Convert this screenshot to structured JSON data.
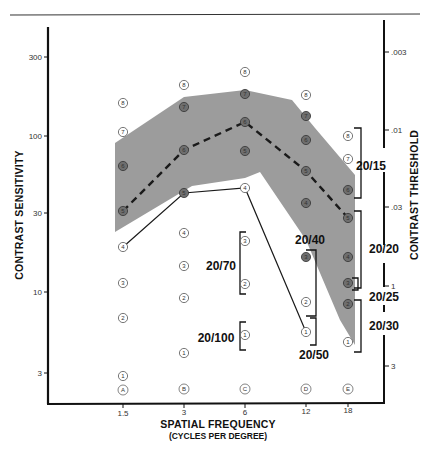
{
  "chart_data": {
    "type": "line",
    "title": "",
    "xlabel": "SPATIAL FREQUENCY",
    "xlabel_sub": "(CYCLES PER DEGREE)",
    "ylabel_left": "CONTRAST SENSITIVITY",
    "ylabel_right": "CONTRAST THRESHOLD",
    "x_ticks": [
      "1.5",
      "3",
      "6",
      "12",
      "18"
    ],
    "x_columns": [
      "A",
      "B",
      "C",
      "D",
      "E"
    ],
    "y_left_ticks": [
      "300",
      "100",
      "30",
      "10",
      "3"
    ],
    "y_right_ticks": [
      ".003",
      ".01",
      ".03",
      ".1",
      ".3"
    ],
    "y_scale": "log",
    "grid": false,
    "series": [
      {
        "name": "Normal population mean (dashed)",
        "style": "dashed",
        "x": [
          1.5,
          3,
          6,
          12,
          18
        ],
        "values": [
          31,
          70,
          120,
          55,
          28
        ],
        "row_labels": [
          5,
          6,
          6,
          5,
          5
        ]
      },
      {
        "name": "Patient curve (solid)",
        "style": "solid",
        "x": [
          1.5,
          3,
          6,
          12,
          18
        ],
        "values": [
          20,
          38,
          40,
          5.5,
          null
        ],
        "row_labels": [
          4,
          5,
          4,
          1,
          null
        ]
      },
      {
        "name": "Normal range upper bound (shaded)",
        "style": "band-upper",
        "x": [
          1.5,
          3,
          6,
          12,
          18
        ],
        "values": [
          85,
          160,
          180,
          110,
          40
        ]
      },
      {
        "name": "Normal range lower bound (shaded)",
        "style": "band-lower",
        "x": [
          1.5,
          3,
          6,
          12,
          18
        ],
        "values": [
          25,
          40,
          42,
          18,
          4
        ]
      }
    ],
    "acuity_labels": [
      "20/15",
      "20/20",
      "20/25",
      "20/30",
      "20/40",
      "20/50",
      "20/70",
      "20/100"
    ],
    "ylim": [
      2.2,
      500
    ]
  },
  "axes": {
    "left_ticks": [
      {
        "label": "300",
        "y": 57
      },
      {
        "label": "100",
        "y": 136
      },
      {
        "label": "30",
        "y": 213
      },
      {
        "label": "10",
        "y": 292
      },
      {
        "label": "3",
        "y": 373
      }
    ],
    "right_ticks": [
      {
        "label": ".003",
        "y": 52
      },
      {
        "label": ".01",
        "y": 130
      },
      {
        "label": ".03",
        "y": 207
      },
      {
        "label": "1",
        "y": 286
      },
      {
        "label": "3",
        "y": 366
      }
    ],
    "x_ticks": [
      {
        "label": "1.5",
        "x": 123
      },
      {
        "label": "3",
        "x": 184
      },
      {
        "label": "6",
        "x": 245
      },
      {
        "label": "12",
        "x": 306
      },
      {
        "label": "18",
        "x": 348
      }
    ],
    "x_title": "SPATIAL FREQUENCY",
    "x_subtitle": "(CYCLES PER DEGREE)",
    "y_left_title": "CONTRAST SENSITIVITY",
    "y_right_title": "CONTRAST THRESHOLD"
  },
  "columns": [
    {
      "letter": "A",
      "x": 123,
      "points": [
        {
          "n": "8",
          "y": 103,
          "fill": "none"
        },
        {
          "n": "7",
          "y": 132,
          "fill": "none"
        },
        {
          "n": "6",
          "y": 166,
          "fill": "dark"
        },
        {
          "n": "5",
          "y": 211,
          "fill": "dark"
        },
        {
          "n": "4",
          "y": 247,
          "fill": "white"
        },
        {
          "n": "3",
          "y": 283,
          "fill": "none"
        },
        {
          "n": "2",
          "y": 318,
          "fill": "none"
        },
        {
          "n": "1",
          "y": 376,
          "fill": "none"
        }
      ],
      "letter_y": 390
    },
    {
      "letter": "B",
      "x": 184,
      "points": [
        {
          "n": "8",
          "y": 85,
          "fill": "none"
        },
        {
          "n": "7",
          "y": 107,
          "fill": "dark"
        },
        {
          "n": "6",
          "y": 150,
          "fill": "dark"
        },
        {
          "n": "5",
          "y": 193,
          "fill": "dark"
        },
        {
          "n": "4",
          "y": 233,
          "fill": "none"
        },
        {
          "n": "3",
          "y": 266,
          "fill": "none"
        },
        {
          "n": "2",
          "y": 298,
          "fill": "none"
        },
        {
          "n": "1",
          "y": 353,
          "fill": "none"
        }
      ],
      "letter_y": 389
    },
    {
      "letter": "C",
      "x": 245,
      "points": [
        {
          "n": "8",
          "y": 72,
          "fill": "none"
        },
        {
          "n": "7",
          "y": 94,
          "fill": "dark"
        },
        {
          "n": "6",
          "y": 122,
          "fill": "dark"
        },
        {
          "n": "5",
          "y": 151,
          "fill": "dark"
        },
        {
          "n": "4",
          "y": 188,
          "fill": "white"
        },
        {
          "n": "3",
          "y": 241,
          "fill": "none"
        },
        {
          "n": "2",
          "y": 284,
          "fill": "none"
        },
        {
          "n": "1",
          "y": 335,
          "fill": "none"
        }
      ],
      "letter_y": 389
    },
    {
      "letter": "D",
      "x": 306,
      "points": [
        {
          "n": "8",
          "y": 95,
          "fill": "none"
        },
        {
          "n": "7",
          "y": 116,
          "fill": "dark"
        },
        {
          "n": "6",
          "y": 140,
          "fill": "dark"
        },
        {
          "n": "5",
          "y": 171,
          "fill": "dark"
        },
        {
          "n": "4",
          "y": 203,
          "fill": "dark"
        },
        {
          "n": "3",
          "y": 257,
          "fill": "dark"
        },
        {
          "n": "2",
          "y": 302,
          "fill": "none"
        },
        {
          "n": "1",
          "y": 332,
          "fill": "none"
        }
      ],
      "letter_y": 389
    },
    {
      "letter": "E",
      "x": 348,
      "points": [
        {
          "n": "8",
          "y": 136,
          "fill": "none"
        },
        {
          "n": "7",
          "y": 159,
          "fill": "none"
        },
        {
          "n": "6",
          "y": 190,
          "fill": "dark"
        },
        {
          "n": "5",
          "y": 218,
          "fill": "dark"
        },
        {
          "n": "4",
          "y": 257,
          "fill": "dark"
        },
        {
          "n": "3",
          "y": 283,
          "fill": "dark"
        },
        {
          "n": "2",
          "y": 304,
          "fill": "dark"
        },
        {
          "n": "1",
          "y": 342,
          "fill": "none"
        }
      ],
      "letter_y": 389
    }
  ],
  "acuity": {
    "a20_15": "20/15",
    "a20_20": "20/20",
    "a20_25": "20/25",
    "a20_30": "20/30",
    "a20_40": "20/40",
    "a20_50": "20/50",
    "a20_70": "20/70",
    "a20_100": "20/100"
  },
  "colors": {
    "band": "#9a9a9a",
    "line": "#1a1a1a",
    "axis": "#111111",
    "dark_point": "#6e6e6e"
  }
}
